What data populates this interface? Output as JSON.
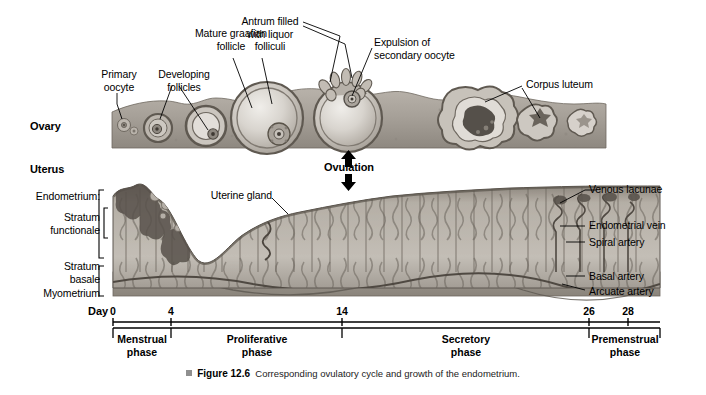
{
  "figure": {
    "number": "Figure 12.6",
    "caption": "Corresponding ovulatory cycle and growth of the endometrium."
  },
  "sections": {
    "ovary_label": "Ovary",
    "uterus_label": "Uterus",
    "ovulation_label": "Ovulation"
  },
  "ovary_labels": {
    "primary_oocyte": "Primary\noocyte",
    "developing_follicles": "Developing\nfollicles",
    "mature_graafian_follicle": "Mature graafian\nfollicle",
    "antrum": "Antrum filled\nwith liquor\nfolliculi",
    "expulsion": "Expulsion of\nsecondary oocyte",
    "corpus_luteum": "Corpus luteum"
  },
  "uterus_labels_left": {
    "endometrium": "Endometrium:",
    "stratum_functionale": "Stratum\nfunctionale",
    "stratum_basale": "Stratum\nbasale",
    "myometrium": "Myometrium"
  },
  "uterus_labels_right": {
    "venous_lacunae": "Venous lacunae",
    "endometrial_vein": "Endometrial vein",
    "spiral_artery": "Spiral artery",
    "basal_artery": "Basal artery",
    "arcuate_artery": "Arcuate artery"
  },
  "uterus_labels_inner": {
    "uterine_gland": "Uterine gland"
  },
  "timeline": {
    "day_prefix": "Day",
    "ticks": [
      {
        "label": "0",
        "x": 113
      },
      {
        "label": "4",
        "x": 171
      },
      {
        "label": "14",
        "x": 342
      },
      {
        "label": "26",
        "x": 589
      },
      {
        "label": "28",
        "x": 628
      }
    ],
    "phases": [
      {
        "label": "Menstrual\nphase",
        "start": 113,
        "end": 171
      },
      {
        "label": "Proliferative\nphase",
        "start": 171,
        "end": 342
      },
      {
        "label": "Secretory\nphase",
        "start": 342,
        "end": 589
      },
      {
        "label": "Premenstrual\nphase",
        "start": 589,
        "end": 660
      }
    ]
  },
  "colors": {
    "line": "#000000",
    "tissue_mid": "#a9a39b",
    "tissue_light": "#cfcac3",
    "tissue_dark": "#6e6861",
    "background": "#ffffff"
  }
}
